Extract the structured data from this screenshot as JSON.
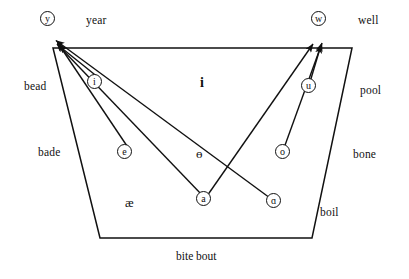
{
  "figure": {
    "type": "ipa-vowel-quadrilateral",
    "background_color": "#ffffff",
    "stroke_color": "#111111"
  },
  "quadrilateral": {
    "name": "vowel-trapezoid",
    "points": "53,48 352,48 312,238 100,238",
    "top_left": [
      53,
      48
    ],
    "top_right": [
      352,
      48
    ],
    "bottom_right": [
      312,
      238
    ],
    "bottom_left": [
      100,
      238
    ]
  },
  "perimeter_labels": {
    "top_left_word": "year",
    "top_right_word": "well",
    "left_upper_word": "bead",
    "left_lower_word": "bade",
    "right_upper_word": "pool",
    "right_mid_word": "bone",
    "right_lower_word": "boil",
    "bottom_words": "bite bout"
  },
  "vowels": [
    {
      "symbol": "y",
      "circled": true,
      "label": "vowel-y",
      "x": 47,
      "y": 19
    },
    {
      "symbol": "w",
      "circled": true,
      "label": "vowel-w",
      "x": 318,
      "y": 19
    },
    {
      "symbol": "i",
      "circled": true,
      "label": "vowel-i",
      "x": 94,
      "y": 82
    },
    {
      "symbol": "u",
      "circled": true,
      "label": "vowel-u",
      "x": 308,
      "y": 86
    },
    {
      "symbol": "e",
      "circled": true,
      "label": "vowel-e",
      "x": 124,
      "y": 152
    },
    {
      "symbol": "o",
      "circled": true,
      "label": "vowel-o",
      "x": 282,
      "y": 152
    },
    {
      "symbol": "a",
      "circled": true,
      "label": "vowel-a",
      "x": 203,
      "y": 199
    },
    {
      "symbol": "ɑ",
      "circled": true,
      "label": "vowel-open-a",
      "x": 273,
      "y": 201
    },
    {
      "symbol": "i",
      "circled": false,
      "label": "vowel-bold-i",
      "x": 203,
      "y": 82
    },
    {
      "symbol": "ɵ",
      "circled": false,
      "label": "vowel-schwa",
      "x": 200,
      "y": 152
    },
    {
      "symbol": "æ",
      "circled": false,
      "label": "vowel-ash",
      "x": 131,
      "y": 202
    }
  ],
  "arrows": [
    {
      "name": "arrow-i-to-y",
      "from": "vowel-i",
      "to": "top-left-corner"
    },
    {
      "name": "arrow-e-to-y",
      "from": "vowel-e",
      "to": "top-left-corner"
    },
    {
      "name": "arrow-a-to-y",
      "from": "vowel-a",
      "to": "top-left-corner"
    },
    {
      "name": "arrow-open-a-to-y",
      "from": "vowel-open-a",
      "to": "top-left-corner"
    },
    {
      "name": "arrow-u-to-w",
      "from": "vowel-u",
      "to": "top-right-corner"
    },
    {
      "name": "arrow-o-to-w",
      "from": "vowel-o",
      "to": "top-right-corner"
    },
    {
      "name": "arrow-a-to-w",
      "from": "vowel-a",
      "to": "top-right-corner"
    }
  ]
}
